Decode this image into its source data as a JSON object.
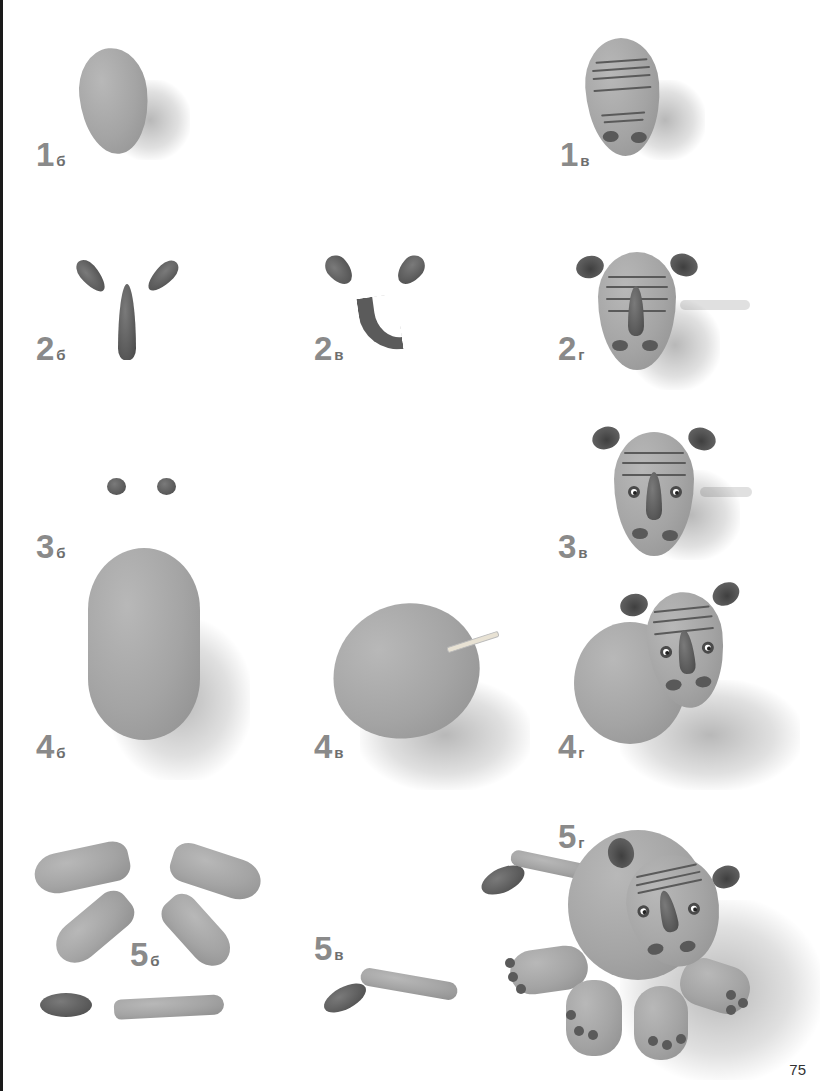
{
  "page": {
    "number": "75",
    "background": "#ffffff",
    "label_color": "#8a8a8a"
  },
  "steps": [
    {
      "id": "1b",
      "num": "1",
      "sub": "б",
      "description": "egg-shaped grey clay head"
    },
    {
      "id": "1v",
      "num": "1",
      "sub": "в",
      "description": "head with stripes and nostrils"
    },
    {
      "id": "2b",
      "num": "2",
      "sub": "б",
      "description": "two ear teardrops and a horn cone"
    },
    {
      "id": "2v",
      "num": "2",
      "sub": "в",
      "description": "shaped ears and curved horn"
    },
    {
      "id": "2g",
      "num": "2",
      "sub": "г",
      "description": "head with ears and horn attached"
    },
    {
      "id": "3b",
      "num": "3",
      "sub": "б",
      "description": "two small dark balls for eyes"
    },
    {
      "id": "3v",
      "num": "3",
      "sub": "в",
      "description": "head with eyes attached"
    },
    {
      "id": "4b",
      "num": "4",
      "sub": "б",
      "description": "large oval body"
    },
    {
      "id": "4v",
      "num": "4",
      "sub": "в",
      "description": "body with toothpick inserted"
    },
    {
      "id": "4g",
      "num": "4",
      "sub": "г",
      "description": "head attached to body"
    },
    {
      "id": "5b",
      "num": "5",
      "sub": "б",
      "description": "four legs, tail tip and tail"
    },
    {
      "id": "5v",
      "num": "5",
      "sub": "в",
      "description": "assembled tail"
    },
    {
      "id": "5g",
      "num": "5",
      "sub": "г",
      "description": "finished rhinoceros figure"
    }
  ]
}
